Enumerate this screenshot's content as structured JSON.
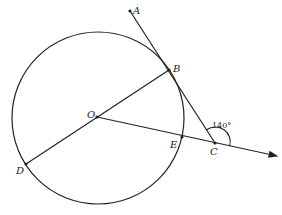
{
  "diagram": {
    "type": "geometry",
    "points": {
      "A": {
        "label": "A",
        "x": 130,
        "y": 11
      },
      "B": {
        "label": "B",
        "x": 169,
        "y": 70
      },
      "O": {
        "label": "O",
        "x": 97,
        "y": 117
      },
      "E": {
        "label": "E",
        "x": 182,
        "y": 137
      },
      "C": {
        "label": "C",
        "x": 215,
        "y": 143
      },
      "D": {
        "label": "D",
        "x": 26,
        "y": 164
      }
    },
    "circle": {
      "center": "O",
      "cx": 98,
      "cy": 118,
      "r": 86
    },
    "segments": [
      "A-C",
      "D-B",
      "O-ray"
    ],
    "angle": {
      "vertex": "C",
      "value": "140°"
    },
    "colors": {
      "stroke": "#222222",
      "background": "#ffffff"
    }
  }
}
